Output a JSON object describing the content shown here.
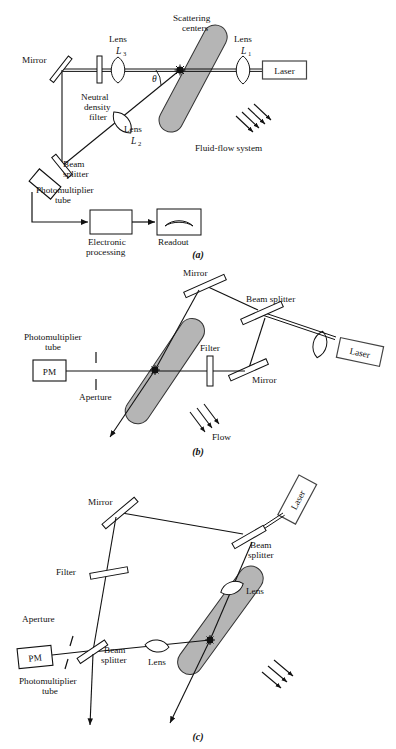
{
  "figure": {
    "domain": "scientific-diagram",
    "colors": {
      "tube_fill": "#b5b5b5",
      "tube_stroke": "#333333",
      "line": "#111111",
      "background": "#ffffff"
    }
  },
  "panels": [
    {
      "id": "a",
      "panel_label": "(a)",
      "labels": {
        "mirror": "Mirror",
        "neutral_density_filter": "Neutral\ndensity\nfilter",
        "neutral_density_filter_l1": "Neutral",
        "neutral_density_filter_l2": "density",
        "neutral_density_filter_l3": "filter",
        "lens3_name": "Lens",
        "lens3_sym": "L",
        "lens3_sub": "3",
        "lens1_name": "Lens",
        "lens1_sym": "L",
        "lens1_sub": "1",
        "lens2_name": "Lens",
        "lens2_sym": "L",
        "lens2_sub": "2",
        "scattering_centers_l1": "Scattering",
        "scattering_centers_l2": "centers",
        "laser": "Laser",
        "fluid_flow_system": "Fluid-flow system",
        "theta": "θ",
        "beam_splitter_l1": "Beam",
        "beam_splitter_l2": "splitter",
        "photomultiplier_l1": "Photomultiplier",
        "photomultiplier_l2": "tube",
        "electronic_l1": "Electronic",
        "electronic_l2": "processing",
        "readout": "Readout"
      }
    },
    {
      "id": "b",
      "panel_label": "(b)",
      "labels": {
        "mirror_top": "Mirror",
        "mirror_bottom": "Mirror",
        "beam_splitter": "Beam splitter",
        "filter": "Filter",
        "laser": "Laser",
        "photomultiplier_l1": "Photomultiplier",
        "photomultiplier_l2": "tube",
        "pm": "PM",
        "aperture": "Aperture",
        "flow": "Flow"
      }
    },
    {
      "id": "c",
      "panel_label": "(c)",
      "labels": {
        "mirror": "Mirror",
        "laser": "Laser",
        "beam_splitter_top_l1": "Beam",
        "beam_splitter_top_l2": "splitter",
        "beam_splitter_bot_l1": "Beam",
        "beam_splitter_bot_l2": "splitter",
        "lens_upper": "Lens",
        "lens_lower": "Lens",
        "filter": "Filter",
        "aperture": "Aperture",
        "pm": "PM",
        "photomultiplier_l1": "Photomultiplier",
        "photomultiplier_l2": "tube"
      }
    }
  ]
}
